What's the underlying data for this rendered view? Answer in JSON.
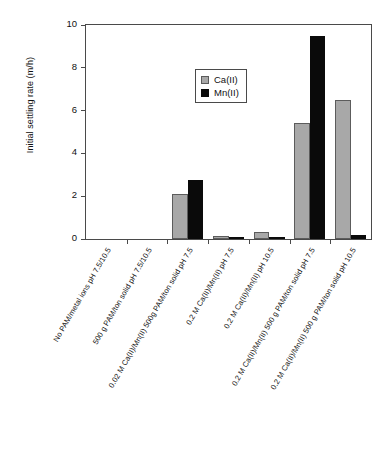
{
  "chart_data": {
    "type": "bar",
    "title": "",
    "xlabel": "",
    "ylabel": "Initial settling rate (m/h)",
    "ylim": [
      0,
      10
    ],
    "yticks": [
      0,
      2,
      4,
      6,
      8,
      10
    ],
    "grid": false,
    "legend_position": "upper-left-inside",
    "categories": [
      "No PAM/metal ions pH 7.5/10.5",
      "500 g PAM/ton solid pH 7.5/10.5",
      "0.02 M Ca(II)/Mn(II) 500g PAM/ton solid pH 7.5",
      "0.2 M Ca(II)/Mn(II) pH 7.5",
      "0.2 M Ca(II)/Mn(II) pH 10.5",
      "0.2 M Ca(II)/Mn(II) 500 g PAM/ton solid pH 7.5",
      "0.2 M Ca(II)/Mn(II) 500 g PAM/ton solid pH 10.5"
    ],
    "series": [
      {
        "name": "Ca(II)",
        "color": "#a8a8a8",
        "values": [
          0,
          0,
          2.1,
          0.15,
          0.33,
          5.4,
          6.5
        ]
      },
      {
        "name": "Mn(II)",
        "color": "#0a0a0a",
        "values": [
          0,
          0,
          2.75,
          0.08,
          0.08,
          9.5,
          0.2
        ]
      }
    ]
  },
  "axis": {
    "y_title": "Initial settling rate (m/h)",
    "y_tick_labels": [
      "0",
      "2",
      "4",
      "6",
      "8",
      "10"
    ]
  },
  "legend": {
    "entries": [
      {
        "label": "Ca(II)",
        "swatch": "gray-square-icon"
      },
      {
        "label": "Mn(II)",
        "swatch": "black-square-icon"
      }
    ]
  }
}
